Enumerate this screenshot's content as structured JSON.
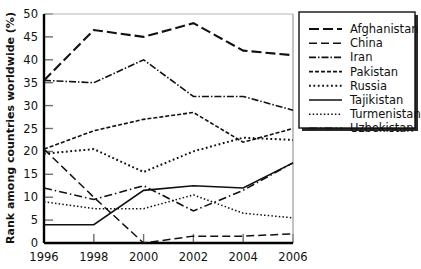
{
  "chart_data": {
    "type": "line",
    "title": "",
    "xlabel": "",
    "ylabel": "Rank among countries worldwide (%)",
    "x": [
      1996,
      1998,
      2000,
      2002,
      2004,
      2006
    ],
    "xtick_labels": [
      "1996",
      "1998",
      "2000",
      "2002",
      "2004",
      "2006"
    ],
    "ytick_labels": [
      "0",
      "5",
      "10",
      "15",
      "20",
      "25",
      "30",
      "35",
      "40",
      "45",
      "50"
    ],
    "yticks": [
      0,
      5,
      10,
      15,
      20,
      25,
      30,
      35,
      40,
      45,
      50
    ],
    "xlim": [
      1996,
      2006
    ],
    "ylim": [
      0,
      50
    ],
    "grid": false,
    "legend_position": "right",
    "series": [
      {
        "name": "Afghanistan",
        "dash": "10,4",
        "width": 2.1,
        "values": [
          35.5,
          46.5,
          45.0,
          48.0,
          42.0,
          41.0
        ]
      },
      {
        "name": "China",
        "dash": "8,4",
        "width": 1.5,
        "values": [
          20.5,
          10.0,
          0.0,
          1.5,
          1.5,
          2.0
        ]
      },
      {
        "name": "Iran",
        "dash": "7,2,1.5,2",
        "width": 1.6,
        "values": [
          35.5,
          35.0,
          40.0,
          32.0,
          32.0,
          29.0
        ]
      },
      {
        "name": "Pakistan",
        "dash": "4,2",
        "width": 1.6,
        "values": [
          20.5,
          24.5,
          27.0,
          28.5,
          22.0,
          25.0
        ]
      },
      {
        "name": "Russia",
        "dash": "1.8,2.6",
        "width": 2.0,
        "values": [
          19.5,
          20.5,
          15.5,
          20.0,
          23.0,
          22.5
        ]
      },
      {
        "name": "Tajikistan",
        "dash": "none",
        "width": 1.6,
        "values": [
          4.0,
          4.0,
          11.5,
          12.5,
          12.0,
          17.5
        ]
      },
      {
        "name": "Turmenistan",
        "dash": "1.5,2.2",
        "width": 1.5,
        "values": [
          9.0,
          7.5,
          7.5,
          10.5,
          6.5,
          5.5
        ]
      },
      {
        "name": "Uzbekistan",
        "dash": "8,3,1.5,3",
        "width": 1.6,
        "values": [
          12.0,
          9.5,
          12.5,
          7.0,
          11.5,
          17.5
        ]
      }
    ]
  },
  "legend": {
    "items": [
      {
        "label": "Afghanistan"
      },
      {
        "label": "China"
      },
      {
        "label": "Iran"
      },
      {
        "label": "Pakistan"
      },
      {
        "label": "Russia"
      },
      {
        "label": "Tajikistan"
      },
      {
        "label": "Turmenistan"
      },
      {
        "label": "Uzbekistan"
      }
    ]
  },
  "axes": {
    "y_axis_title": "Rank among countries worldwide (%)"
  }
}
